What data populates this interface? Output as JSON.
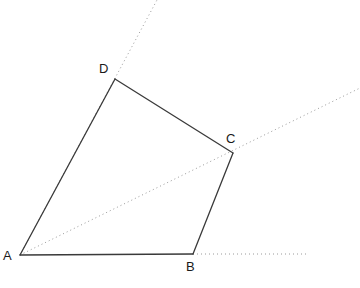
{
  "figure": {
    "canvas": {
      "width": 360,
      "height": 288,
      "background": "#ffffff"
    },
    "style": {
      "solid_color": "#3a3a3a",
      "solid_width": 1.3,
      "dotted_color": "#9a9a9a",
      "dotted_width": 1,
      "dash_pattern": "1,3",
      "label_color": "#1a1a1a",
      "label_size": "13px"
    },
    "points": {
      "A": {
        "name": "A",
        "x": 20,
        "y": 255
      },
      "B": {
        "name": "B",
        "x": 193,
        "y": 254
      },
      "C": {
        "name": "C",
        "x": 233,
        "y": 153
      },
      "D": {
        "name": "D",
        "x": 115,
        "y": 79
      }
    },
    "labels": [
      {
        "text": "A",
        "x": 3,
        "y": 249,
        "anchor": "left-of-vertex"
      },
      {
        "text": "B",
        "x": 186,
        "y": 260,
        "anchor": "below-vertex"
      },
      {
        "text": "C",
        "x": 226,
        "y": 132,
        "anchor": "above-left-of-vertex"
      },
      {
        "text": "D",
        "x": 99,
        "y": 62,
        "anchor": "above-left-of-vertex"
      }
    ],
    "solid_edges": [
      {
        "name": "edge-AB",
        "from": "A",
        "to": "B",
        "x1": 20,
        "y1": 255,
        "x2": 193,
        "y2": 254
      },
      {
        "name": "edge-BC",
        "from": "B",
        "to": "C",
        "x1": 193,
        "y1": 254,
        "x2": 233,
        "y2": 153
      },
      {
        "name": "edge-CD",
        "from": "C",
        "to": "D",
        "x1": 233,
        "y1": 153,
        "x2": 115,
        "y2": 79
      },
      {
        "name": "edge-DA",
        "from": "D",
        "to": "A",
        "x1": 115,
        "y1": 79,
        "x2": 20,
        "y2": 255
      }
    ],
    "dotted_rays": [
      {
        "name": "ray-AD-extended",
        "from": "A",
        "through": "D",
        "x1": 20,
        "y1": 255,
        "x2": 157,
        "y2": 0
      },
      {
        "name": "ray-AC-extended",
        "from": "A",
        "through": "C",
        "x1": 20,
        "y1": 255,
        "x2": 360,
        "y2": 88
      },
      {
        "name": "ray-B-horizontal",
        "from": "B",
        "through": "right",
        "x1": 193,
        "y1": 254,
        "x2": 307,
        "y2": 254
      }
    ]
  }
}
